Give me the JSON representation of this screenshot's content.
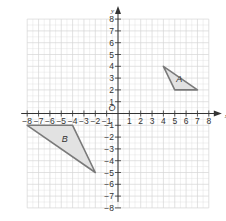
{
  "diagram": {
    "type": "coordinate-grid",
    "x_range": [
      -8,
      8
    ],
    "y_range": [
      -8,
      8
    ],
    "x_axis_label": "x",
    "y_axis_label": "y",
    "origin_label": "O",
    "x_ticks": [
      "-8",
      "-7",
      "-6",
      "-5",
      "-4",
      "-3",
      "-2",
      "-1",
      "1",
      "2",
      "3",
      "4",
      "5",
      "6",
      "7",
      "8"
    ],
    "y_ticks": [
      "8",
      "7",
      "6",
      "5",
      "4",
      "3",
      "2",
      "1",
      "-1",
      "-2",
      "-3",
      "-4",
      "-5",
      "-6",
      "-7",
      "-8"
    ],
    "shapes": [
      {
        "label": "A",
        "vertices": [
          [
            4,
            4
          ],
          [
            5,
            2
          ],
          [
            7,
            2
          ]
        ],
        "fill": "#e2e2e2",
        "stroke": "#7a7a7a",
        "label_pos": [
          5.4,
          2.7
        ]
      },
      {
        "label": "B",
        "vertices": [
          [
            -8,
            -1
          ],
          [
            -4,
            -1
          ],
          [
            -2,
            -5
          ]
        ],
        "fill": "#e2e2e2",
        "stroke": "#7a7a7a",
        "label_pos": [
          -4.7,
          -2.4
        ]
      }
    ],
    "colors": {
      "grid": "#d6d6d6",
      "axis": "#333333"
    }
  }
}
